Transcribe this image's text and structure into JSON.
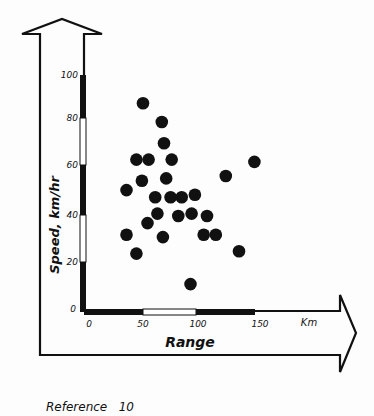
{
  "chart_data": {
    "type": "scatter",
    "title": "",
    "xlabel": "Range",
    "ylabel": "Speed, km/hr",
    "x_unit_label": "Km",
    "xlim": [
      0,
      150
    ],
    "ylim": [
      0,
      100
    ],
    "x_ticks": [
      "0",
      "50",
      "100",
      "150"
    ],
    "y_ticks": [
      "0",
      "20",
      "40",
      "60",
      "80",
      "100"
    ],
    "grid": false,
    "legend": null,
    "caption": "Reference 10",
    "points": [
      {
        "x": 49,
        "y": 88
      },
      {
        "x": 66,
        "y": 80
      },
      {
        "x": 68,
        "y": 71
      },
      {
        "x": 43,
        "y": 64
      },
      {
        "x": 54,
        "y": 64
      },
      {
        "x": 75,
        "y": 64
      },
      {
        "x": 150,
        "y": 63
      },
      {
        "x": 48,
        "y": 55
      },
      {
        "x": 70,
        "y": 56
      },
      {
        "x": 124,
        "y": 57
      },
      {
        "x": 34,
        "y": 51
      },
      {
        "x": 60,
        "y": 48
      },
      {
        "x": 74,
        "y": 48
      },
      {
        "x": 84,
        "y": 48
      },
      {
        "x": 96,
        "y": 49
      },
      {
        "x": 62,
        "y": 41
      },
      {
        "x": 53,
        "y": 37
      },
      {
        "x": 81,
        "y": 40
      },
      {
        "x": 93,
        "y": 41
      },
      {
        "x": 107,
        "y": 40
      },
      {
        "x": 34,
        "y": 32
      },
      {
        "x": 67,
        "y": 31
      },
      {
        "x": 104,
        "y": 32
      },
      {
        "x": 115,
        "y": 32
      },
      {
        "x": 43,
        "y": 24
      },
      {
        "x": 136,
        "y": 25
      },
      {
        "x": 92,
        "y": 11
      }
    ]
  },
  "labels": {
    "y_axis_title": "Speed,  km/hr",
    "x_axis_title": "Range",
    "x_unit": "Km",
    "caption": "Reference   10",
    "y_tick_0": "0",
    "y_tick_20": "20",
    "y_tick_40": "40",
    "y_tick_60": "60",
    "y_tick_80": "80",
    "y_tick_100": "100",
    "x_tick_0": "0",
    "x_tick_50": "50",
    "x_tick_100": "100",
    "x_tick_150": "150"
  },
  "colors": {
    "ink": "#111111",
    "paper": "#fdfdfd"
  }
}
